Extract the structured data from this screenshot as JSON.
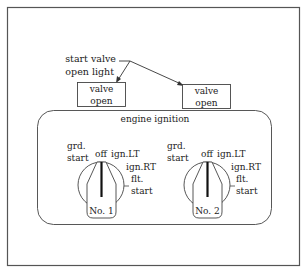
{
  "callout": {
    "line1": "start valve",
    "line2": "open light"
  },
  "indicators": [
    {
      "line1": "valve",
      "line2": "open"
    },
    {
      "line1": "valve",
      "line2": "open"
    }
  ],
  "panel": {
    "title": "engine ignition"
  },
  "switches": [
    {
      "name": "No. 1",
      "positions": {
        "grd_line1": "grd.",
        "grd_line2": "start",
        "off": "off",
        "ign_lt": "ign.LT",
        "ign_rt": "ign.RT",
        "flt_line1": "flt.",
        "flt_line2": "start"
      },
      "selected": "off"
    },
    {
      "name": "No. 2",
      "positions": {
        "grd_line1": "grd.",
        "grd_line2": "start",
        "off": "off",
        "ign_lt": "ign.LT",
        "ign_rt": "ign.RT",
        "flt_line1": "flt.",
        "flt_line2": "start"
      },
      "selected": "off"
    }
  ],
  "colors": {
    "stroke": "#444444",
    "text": "#222222",
    "pointer": "#111111"
  }
}
